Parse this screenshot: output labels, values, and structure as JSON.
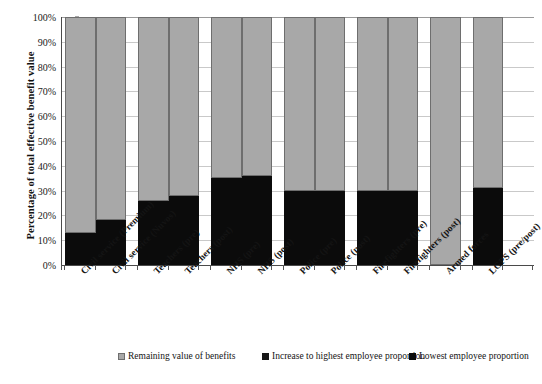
{
  "chart_data": {
    "type": "bar",
    "subtype": "stacked-100-percent",
    "title": "",
    "xlabel": "",
    "ylabel": "Percentage of total effective benefit value",
    "ylim": [
      0,
      100
    ],
    "yticks": [
      "0%",
      "10%",
      "20%",
      "30%",
      "40%",
      "50%",
      "60%",
      "70%",
      "80%",
      "90%",
      "100%"
    ],
    "ytick_values": [
      0,
      10,
      20,
      30,
      40,
      50,
      60,
      70,
      80,
      90,
      100
    ],
    "grid": true,
    "legend_position": "bottom",
    "categories": [
      "Civil service (Premium)",
      "Civil service (Nuvos)",
      "Teachers (pre)",
      "Teachers (post)",
      "NHS (pre)",
      "NHS (post)",
      "Police (pre)",
      "Police (post)",
      "Firefighters (pre)",
      "Firefighters (post)",
      "Armed forces",
      "LGPS (pre/post)"
    ],
    "series": [
      {
        "name": "Lowest employee proportion",
        "color": "#0b0b0b",
        "values": [
          13,
          18,
          26,
          28,
          35,
          36,
          30,
          30,
          30,
          30,
          0,
          31
        ]
      },
      {
        "name": "Increase to highest employee proportion",
        "color": "#171717",
        "values": [
          0,
          0,
          0,
          0,
          0,
          0,
          0,
          0,
          0,
          0,
          0,
          0
        ]
      },
      {
        "name": "Remaining value of benefits",
        "color": "#a8a8a8",
        "values": [
          87,
          82,
          74,
          72,
          65,
          64,
          70,
          70,
          70,
          70,
          100,
          69
        ]
      }
    ],
    "group_breaks_after": [
      1,
      3,
      5,
      7,
      9,
      10
    ]
  },
  "legend": {
    "items": [
      {
        "label": "Remaining value of benefits",
        "color": "#a8a8a8",
        "icon": "square-swatch-gray"
      },
      {
        "label": "Increase to highest employee proportion",
        "color": "#171717",
        "icon": "square-swatch-black"
      },
      {
        "label": "Lowest employee proportion",
        "color": "#0b0b0b",
        "icon": "square-swatch-black"
      }
    ]
  }
}
